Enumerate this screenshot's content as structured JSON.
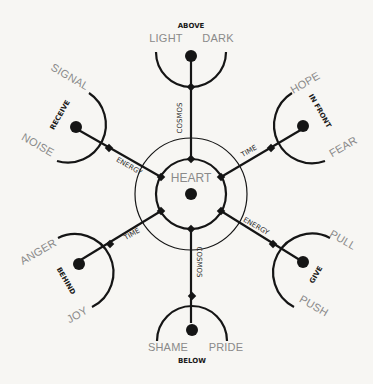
{
  "center": {
    "label": "HEART"
  },
  "directions": {
    "above": "ABOVE",
    "below": "BELOW",
    "receive": "RECEIVE",
    "in_front": "IN FRONT",
    "behind": "BEHIND",
    "give": "GIVE"
  },
  "axes": {
    "cosmos": "COSMOS",
    "energy": "ENERGY",
    "time": "TIME"
  },
  "poles": {
    "above_left": "LIGHT",
    "above_right": "DARK",
    "receive_top": "SIGNAL",
    "receive_bottom": "NOISE",
    "front_top": "HOPE",
    "front_bottom": "FEAR",
    "behind_top": "ANGER",
    "behind_bottom": "JOY",
    "give_top": "PULL",
    "give_bottom": "PUSH",
    "below_left": "SHAME",
    "below_right": "PRIDE"
  },
  "colors": {
    "line": "#151515",
    "label": "#8a8a8a",
    "background": "#f7f6f3"
  }
}
